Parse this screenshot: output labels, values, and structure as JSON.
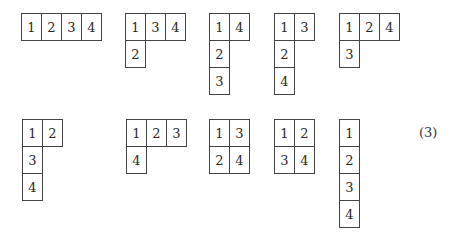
{
  "figure": {
    "equation_label": "(3)",
    "cell_width": 20,
    "cell_height": 27,
    "tableaux": [
      {
        "x": 21,
        "y": 13,
        "rows": [
          [
            "1",
            "2",
            "3",
            "4"
          ]
        ]
      },
      {
        "x": 125,
        "y": 13,
        "rows": [
          [
            "1",
            "3",
            "4"
          ],
          [
            "2"
          ]
        ]
      },
      {
        "x": 209,
        "y": 13,
        "rows": [
          [
            "1",
            "4"
          ],
          [
            "2"
          ],
          [
            "3"
          ]
        ]
      },
      {
        "x": 274,
        "y": 13,
        "rows": [
          [
            "1",
            "3"
          ],
          [
            "2"
          ],
          [
            "4"
          ]
        ]
      },
      {
        "x": 339,
        "y": 13,
        "rows": [
          [
            "1",
            "2",
            "4"
          ],
          [
            "3"
          ]
        ]
      },
      {
        "x": 22,
        "y": 119,
        "rows": [
          [
            "1",
            "2"
          ],
          [
            "3"
          ],
          [
            "4"
          ]
        ]
      },
      {
        "x": 126,
        "y": 119,
        "rows": [
          [
            "1",
            "2",
            "3"
          ],
          [
            "4"
          ]
        ]
      },
      {
        "x": 209,
        "y": 119,
        "rows": [
          [
            "1",
            "3"
          ],
          [
            "2",
            "4"
          ]
        ]
      },
      {
        "x": 274,
        "y": 119,
        "rows": [
          [
            "1",
            "2"
          ],
          [
            "3",
            "4"
          ]
        ]
      },
      {
        "x": 339,
        "y": 119,
        "rows": [
          [
            "1"
          ],
          [
            "2"
          ],
          [
            "3"
          ],
          [
            "4"
          ]
        ]
      }
    ]
  }
}
